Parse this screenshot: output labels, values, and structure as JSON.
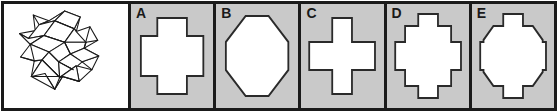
{
  "figure": {
    "type": "spatial-reasoning-cross-section-item",
    "colors": {
      "panel_background": "#c9c9c9",
      "stimulus_background": "#ffffff",
      "line": "#1a1a1a",
      "shape_fill": "#ffffff"
    }
  },
  "stimulus": {
    "label": "three-dimensional cross solid",
    "description": "Isometric line drawing of a plus/cross-shaped prism shown at an oblique angle",
    "line_color": "#1a1a1a",
    "fill": "#ffffff"
  },
  "options": [
    {
      "letter": "A",
      "shape": "thick-greek-cross",
      "description": "White Greek cross with broad arms",
      "arm_ratio": 0.46
    },
    {
      "letter": "B",
      "shape": "octagon",
      "description": "White octagon with large chamfered corners",
      "corner_cut": 0.32
    },
    {
      "letter": "C",
      "shape": "thin-greek-cross",
      "description": "White Greek cross with narrow arms",
      "arm_ratio": 0.33
    },
    {
      "letter": "D",
      "shape": "square-with-tabs",
      "description": "White square with a small rectangular tab centered on each side",
      "tab_ratio": 0.3
    },
    {
      "letter": "E",
      "shape": "octagon-with-tabs",
      "description": "White octagon with a small rectangular tab centered on each side",
      "tab_ratio": 0.3
    }
  ]
}
